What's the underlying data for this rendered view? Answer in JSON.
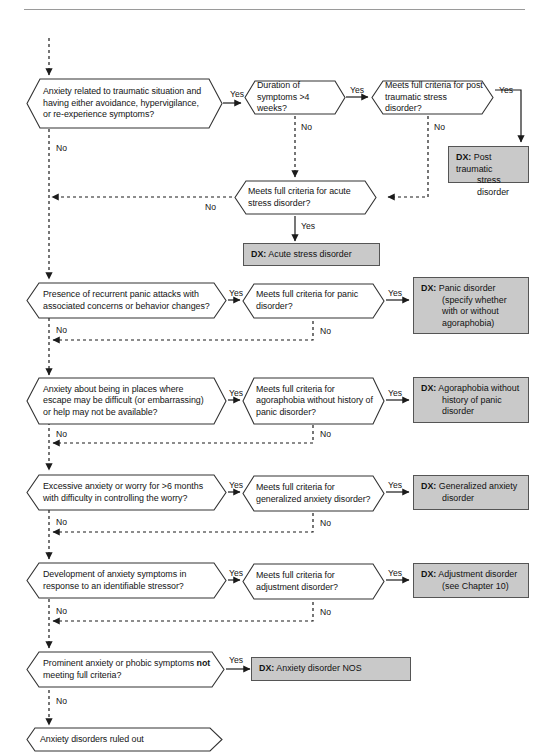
{
  "page": {
    "rule_color": "#9a9a9a",
    "box_fill": "#c9c9c9",
    "box_border": "#555555",
    "node_border": "#333333",
    "yes_label": "Yes",
    "no_label": "No",
    "dx_prefix": "DX:"
  },
  "nodes": {
    "q_ptsd_trauma": "Anxiety related to traumatic situation and having either avoidance, hypervigilance, or re-experience symptoms?",
    "q_duration": "Duration of symptoms >4 weeks?",
    "q_ptsd_criteria": "Meets full criteria for post traumatic stress disorder?",
    "q_acute_criteria": "Meets full criteria for acute stress disorder?",
    "q_panic_presence": "Presence of recurrent panic attacks with associated concerns or behavior changes?",
    "q_panic_criteria": "Meets full criteria for panic disorder?",
    "q_agora_presence": "Anxiety about being in places where escape may be difficult (or embarrassing) or help may not be available?",
    "q_agora_criteria": "Meets full criteria for agoraphobia without history of panic disorder?",
    "q_gad_presence": "Excessive anxiety or worry for >6 months with difficulty in controlling the worry?",
    "q_gad_criteria": "Meets full criteria for generalized anxiety disorder?",
    "q_adjust_presence": "Development of anxiety symptoms in response to an identifiable stressor?",
    "q_adjust_criteria": "Meets full criteria for adjustment disorder?",
    "q_nos_presence_a": "Prominent anxiety or phobic symptoms ",
    "q_nos_presence_b": "not",
    "q_nos_presence_c": " meeting full criteria?",
    "terminal_ruled_out": "Anxiety disorders ruled out"
  },
  "diagnoses": {
    "ptsd": {
      "line1": "Post traumatic",
      "line2": "stress disorder"
    },
    "acute": {
      "line1": "Acute stress disorder"
    },
    "panic": {
      "line1": "Panic disorder",
      "line2": "(specify whether",
      "line3": "with or without",
      "line4": "agoraphobia)"
    },
    "agoraphobia": {
      "line1": "Agoraphobia without",
      "line2": "history of panic",
      "line3": "disorder"
    },
    "gad": {
      "line1": "Generalized anxiety",
      "line2": "disorder"
    },
    "adjustment": {
      "line1": "Adjustment disorder",
      "line2": "(see Chapter 10)"
    },
    "nos": {
      "line1": "Anxiety disorder NOS"
    }
  },
  "edges": {
    "yes_ptsd_trauma": "Yes",
    "no_ptsd_trauma": "No",
    "yes_duration": "Yes",
    "no_duration": "No",
    "yes_ptsd_criteria": "Yes",
    "no_ptsd_criteria": "No",
    "no_acute_criteria": "No",
    "yes_acute_criteria": "Yes",
    "yes_panic_presence": "Yes",
    "no_panic_presence": "No",
    "yes_panic_criteria": "Yes",
    "no_panic_criteria": "No",
    "yes_agora_presence": "Yes",
    "no_agora_presence": "No",
    "yes_agora_criteria": "Yes",
    "no_agora_criteria": "No",
    "yes_gad_presence": "Yes",
    "no_gad_presence": "No",
    "yes_gad_criteria": "Yes",
    "no_gad_criteria": "No",
    "yes_adjust_presence": "Yes",
    "no_adjust_presence": "No",
    "yes_adjust_criteria": "Yes",
    "no_adjust_criteria": "No",
    "yes_nos": "Yes",
    "no_nos": "No"
  }
}
